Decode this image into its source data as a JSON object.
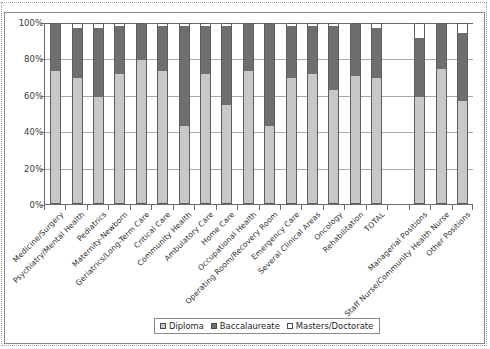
{
  "chart_data": {
    "type": "bar",
    "subtype": "stacked-100-percent",
    "title": "",
    "xlabel": "",
    "ylabel": "",
    "ylim": [
      0,
      100
    ],
    "ytick_labels": [
      "0%",
      "20%",
      "40%",
      "60%",
      "80%",
      "100%"
    ],
    "ytick_values": [
      0,
      20,
      40,
      60,
      80,
      100
    ],
    "grid": true,
    "legend_position": "bottom-center",
    "legend_entries": [
      "Diploma",
      "Baccalaureate",
      "Masters/Doctorate"
    ],
    "categories": [
      "Medicine/Surgery",
      "Psychiatry/Mental Health",
      "Pediatrics",
      "Maternity-Newborn",
      "Geriatrics/Long-Term Care",
      "Critical Care",
      "Community Health",
      "Ambulatory Care",
      "Home Care",
      "Occupational Health",
      "Operating Room/Recovery Room",
      "Emergency Care",
      "Several Clinical Areas",
      "Oncology",
      "Rehabilitation",
      "TOTAL",
      "",
      "Managerial Positions",
      "Staff Nurse/Community Health Nurse",
      "Other Positions"
    ],
    "series": [
      {
        "name": "Diploma",
        "color": "#c8c8c8",
        "values": [
          74,
          70,
          59,
          72,
          80,
          74,
          43,
          72,
          55,
          74,
          43,
          70,
          72,
          63,
          71,
          70,
          null,
          59,
          75,
          57
        ]
      },
      {
        "name": "Baccalaureate",
        "color": "#6e6e6e",
        "values": [
          26,
          28,
          39,
          27,
          20,
          25,
          56,
          27,
          44,
          26,
          57,
          29,
          27,
          36,
          29,
          28,
          null,
          33,
          25,
          38
        ]
      },
      {
        "name": "Masters/Doctorate",
        "color": "#ffffff",
        "values": [
          0,
          2,
          2,
          1,
          0,
          1,
          1,
          1,
          1,
          0,
          0,
          1,
          1,
          1,
          0,
          2,
          null,
          8,
          0,
          5
        ]
      }
    ]
  },
  "legend": {
    "items": [
      {
        "label": "Diploma",
        "swatch_class": "sw-dip",
        "icon": "legend-swatch-icon"
      },
      {
        "label": "Baccalaureate",
        "swatch_class": "sw-bacc",
        "icon": "legend-swatch-icon"
      },
      {
        "label": "Masters/Doctorate",
        "swatch_class": "sw-mast",
        "icon": "legend-swatch-icon"
      }
    ]
  },
  "colors": {
    "diploma": "#c8c8c8",
    "baccalaureate": "#6e6e6e",
    "masters_doctorate": "#ffffff",
    "axis": "#6b6b6b",
    "grid": "#a8a8a8",
    "frame": "#8a8a8a"
  }
}
